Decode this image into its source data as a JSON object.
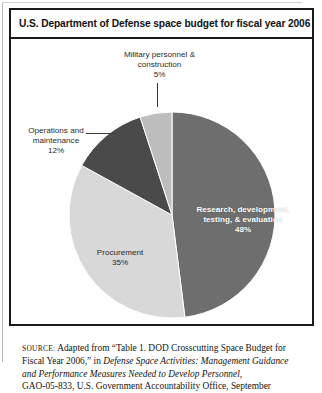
{
  "figure": {
    "title": "U.S. Department of Defense space budget for fiscal year 2006"
  },
  "chart_data": {
    "type": "pie",
    "title": "U.S. Department of Defense space budget for fiscal year 2006",
    "units": "percent of total space budget",
    "start_angle_deg": 0,
    "direction": "clockwise",
    "legend": "none (direct labels)",
    "categories": [
      "Research, development, testing, & evaluation",
      "Procurement",
      "Operations and maintenance",
      "Military personnel & construction"
    ],
    "values": [
      48,
      35,
      12,
      5
    ],
    "total": 100,
    "slices": [
      {
        "label": "Research, development, testing, & evaluation",
        "label_line1": "Research, development,",
        "label_line2": "testing, & evaluation",
        "value": 48,
        "value_text": "48%",
        "color": "#6e6e6e",
        "label_placement": "inside",
        "label_color": "#ffffff"
      },
      {
        "label": "Procurement",
        "label_line1": "Procurement",
        "value": 35,
        "value_text": "35%",
        "color": "#d8d8d8",
        "label_placement": "inside",
        "label_color": "#2b2b2b"
      },
      {
        "label": "Operations and maintenance",
        "label_line1": "Operations and",
        "label_line2": "maintenance",
        "value": 12,
        "value_text": "12%",
        "color": "#4a4a4a",
        "label_placement": "outside-left",
        "label_color": "#2b2b2b"
      },
      {
        "label": "Military personnel & construction",
        "label_line1": "Military personnel &",
        "label_line2": "construction",
        "value": 5,
        "value_text": "5%",
        "color": "#bdbdbd",
        "label_placement": "outside-top",
        "label_color": "#2b2b2b"
      }
    ]
  },
  "source": {
    "label": "SOURCE:",
    "line1_rest": " Adapted from “Table 1. DOD Crosscutting Space Budget for",
    "line2_plain": "Fiscal Year 2006,” in ",
    "line2_italic": "Defense Space Activities: Management Guidance",
    "line3_italic": "and Performance Measures Needed to Develop Personnel",
    "line3_plain": ",",
    "line4": "GAO-05-833, U.S. Government Accountability Office, September"
  }
}
